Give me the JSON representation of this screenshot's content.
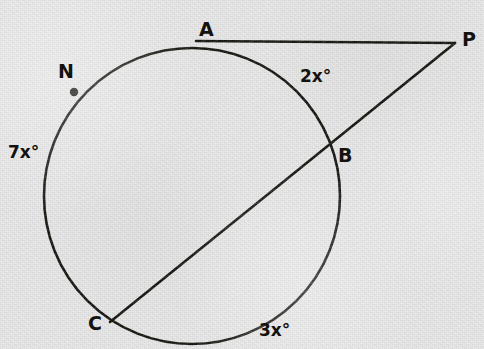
{
  "figure": {
    "type": "circle-geometry-diagram",
    "stroke_color": "#17150f",
    "background_color": "#e9e9e9",
    "points": [
      {
        "id": "A",
        "label": "A",
        "x": 206,
        "y": 41,
        "label_x": 199,
        "label_y": 20,
        "kind": "tangent-point",
        "dot": false
      },
      {
        "id": "P",
        "label": "P",
        "x": 455,
        "y": 43,
        "label_x": 462,
        "label_y": 30,
        "kind": "external-vertex",
        "dot": false
      },
      {
        "id": "B",
        "label": "B",
        "x": 329,
        "y": 147,
        "label_x": 338,
        "label_y": 146,
        "kind": "secant-intersection",
        "dot": false
      },
      {
        "id": "C",
        "label": "C",
        "x": 112,
        "y": 321,
        "label_x": 88,
        "label_y": 314,
        "kind": "secant-intersection",
        "dot": false
      },
      {
        "id": "N",
        "label": "N",
        "x": 74,
        "y": 92,
        "label_x": 58,
        "label_y": 62,
        "kind": "marked-point",
        "dot": true
      }
    ],
    "arc_labels": [
      {
        "id": "arc-AB",
        "text": "2x°",
        "x": 300,
        "y": 68
      },
      {
        "id": "arc-BC",
        "text": "3x°",
        "x": 259,
        "y": 322
      },
      {
        "id": "arc-CNA",
        "text": "7x°",
        "x": 8,
        "y": 144
      }
    ],
    "circle": {
      "cx": 192,
      "cy": 196,
      "r": 148
    },
    "segments": [
      {
        "id": "tangent-AP",
        "from": "A",
        "to": "P",
        "x1": 196,
        "y1": 41,
        "x2": 455,
        "y2": 43
      },
      {
        "id": "secant-PC",
        "from": "P",
        "to": "C",
        "x1": 455,
        "y1": 43,
        "x2": 110,
        "y2": 322
      }
    ]
  }
}
